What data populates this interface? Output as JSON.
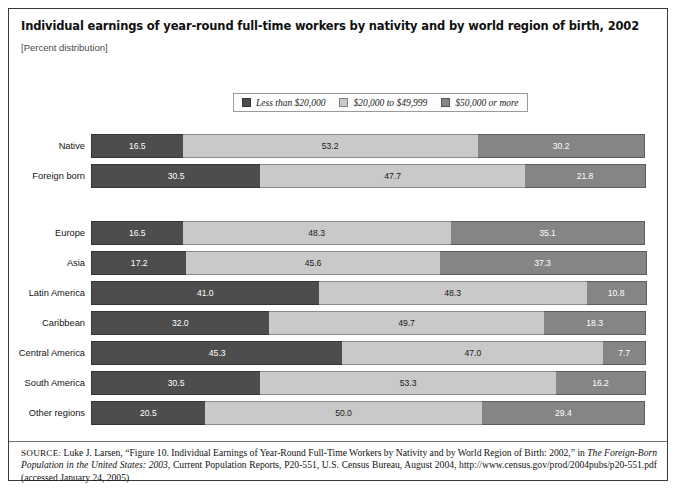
{
  "figure": {
    "title": "Individual earnings of year-round full-time workers by nativity and by world region of birth, 2002",
    "subtitle": "[Percent distribution]",
    "source_prefix": "SOURCE:",
    "source_part1": " Luke J. Larsen, “Figure 10. Individual Earnings of Year-Round Full-Time Workers by Nativity and by World Region of Birth: 2002,” in ",
    "source_italic1": "The Foreign-Born Population in the United States: 2003",
    "source_part2": ", Current Population Reports, P20-551, U.S. Census Bureau, August 2004, http://www.census.gov/prod/2004pubs/p20-551.pdf (accessed January 24, 2005)"
  },
  "colors": {
    "series_low": "#4d4d4d",
    "series_mid": "#c9c9c9",
    "series_high": "#858585",
    "frame": "#3a3a3a",
    "page_background": "#ffffff"
  },
  "legend": {
    "items": [
      {
        "label": "Less than $20,000",
        "color": "#4d4d4d",
        "swatch_name": "legend-swatch-less-than-20000"
      },
      {
        "label": "$20,000 to $49,999",
        "color": "#c9c9c9",
        "swatch_name": "legend-swatch-20000-to-49999"
      },
      {
        "label": "$50,000 or more",
        "color": "#858585",
        "swatch_name": "legend-swatch-50000-or-more"
      }
    ]
  },
  "chart_data": {
    "type": "bar",
    "orientation": "horizontal",
    "stacked": true,
    "title": "Individual earnings of year-round full-time workers by nativity and by world region of birth, 2002",
    "subtitle": "[Percent distribution]",
    "xlabel": "",
    "ylabel": "",
    "xlim": [
      0,
      100
    ],
    "grid": false,
    "legend_position": "top-center",
    "units": "percent",
    "categories": [
      "Native",
      "Foreign born",
      "Europe",
      "Asia",
      "Latin America",
      "Caribbean",
      "Central America",
      "South America",
      "Other regions"
    ],
    "series": [
      {
        "name": "Less than $20,000",
        "color": "#4d4d4d",
        "values": [
          16.5,
          30.5,
          16.5,
          17.2,
          41.0,
          32.0,
          45.3,
          30.5,
          20.5
        ]
      },
      {
        "name": "$20,000 to $49,999",
        "color": "#c9c9c9",
        "values": [
          53.2,
          47.7,
          48.3,
          45.6,
          48.3,
          49.7,
          47.0,
          53.3,
          50.0
        ]
      },
      {
        "name": "$50,000 or more",
        "color": "#858585",
        "values": [
          30.2,
          21.8,
          35.1,
          37.3,
          10.8,
          18.3,
          7.7,
          16.2,
          29.4
        ]
      }
    ],
    "group_break_after_index": 1
  },
  "rows": [
    {
      "label": "Native",
      "values": [
        "16.5",
        "53.2",
        "30.2"
      ]
    },
    {
      "label": "Foreign born",
      "values": [
        "30.5",
        "47.7",
        "21.8"
      ]
    },
    {
      "label": "Europe",
      "values": [
        "16.5",
        "48.3",
        "35.1"
      ]
    },
    {
      "label": "Asia",
      "values": [
        "17.2",
        "45.6",
        "37.3"
      ]
    },
    {
      "label": "Latin America",
      "values": [
        "41.0",
        "48.3",
        "10.8"
      ]
    },
    {
      "label": "Caribbean",
      "values": [
        "32.0",
        "49.7",
        "18.3"
      ]
    },
    {
      "label": "Central America",
      "values": [
        "45.3",
        "47.0",
        "7.7"
      ]
    },
    {
      "label": "South America",
      "values": [
        "30.5",
        "53.3",
        "16.2"
      ]
    },
    {
      "label": "Other regions",
      "values": [
        "20.5",
        "50.0",
        "29.4"
      ]
    }
  ]
}
